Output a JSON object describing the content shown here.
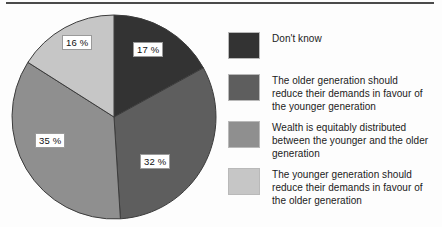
{
  "chart_data": {
    "type": "pie",
    "title": "",
    "subtitle": "",
    "xlabel": "",
    "ylabel": "",
    "legend_position": "right",
    "grid": false,
    "start_angle_deg": 0,
    "direction": "clockwise",
    "categories": [
      "Don't know",
      "The older generation should reduce their demands in favour of the younger generation",
      "Wealth is equitably distributed between the younger and the older generation",
      "The younger generation should reduce their demands in favour of the older generation"
    ],
    "values": [
      17,
      32,
      35,
      16
    ],
    "value_labels": [
      "17 %",
      "32 %",
      "35 %",
      "16 %"
    ],
    "colors": [
      "#333333",
      "#5e5e5e",
      "#8f8f8f",
      "#c6c6c6"
    ],
    "units": "%"
  },
  "pie": {
    "outline_color": "#3c3c3c",
    "slices": [
      {
        "label": "17 %",
        "value": 17,
        "color": "#333333"
      },
      {
        "label": "32 %",
        "value": 32,
        "color": "#5e5e5e"
      },
      {
        "label": "35 %",
        "value": 35,
        "color": "#8f8f8f"
      },
      {
        "label": "16 %",
        "value": 16,
        "color": "#c6c6c6"
      }
    ]
  },
  "legend": {
    "items": [
      {
        "swatch_color": "#333333",
        "text": "Don't know"
      },
      {
        "swatch_color": "#5e5e5e",
        "text": "The older generation should\nreduce their demands in favour of\nthe younger generation"
      },
      {
        "swatch_color": "#8f8f8f",
        "text": "Wealth is equitably distributed\nbetween the younger and the older\ngeneration"
      },
      {
        "swatch_color": "#c6c6c6",
        "text": "The younger generation should\nreduce their demands in favour of\nthe older generation"
      }
    ]
  }
}
